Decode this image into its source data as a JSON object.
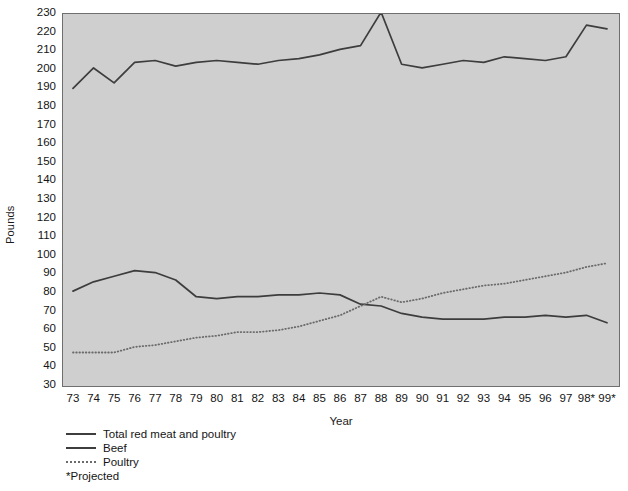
{
  "chart_data": {
    "type": "line",
    "title": "",
    "xlabel": "Year",
    "ylabel": "Pounds",
    "ylim": [
      30,
      230
    ],
    "ytick_step": 10,
    "grid": false,
    "legend_position": "below-left",
    "x": [
      "73",
      "74",
      "75",
      "76",
      "77",
      "78",
      "79",
      "80",
      "81",
      "82",
      "83",
      "84",
      "85",
      "86",
      "87",
      "88",
      "89",
      "90",
      "91",
      "92",
      "93",
      "94",
      "95",
      "96",
      "97",
      "98*",
      "99*"
    ],
    "categories": [
      "73",
      "74",
      "75",
      "76",
      "77",
      "78",
      "79",
      "80",
      "81",
      "82",
      "83",
      "84",
      "85",
      "86",
      "87",
      "88",
      "89",
      "90",
      "91",
      "92",
      "93",
      "94",
      "95",
      "96",
      "97",
      "98*",
      "99*"
    ],
    "ytick_labels": [
      "230",
      "220",
      "210",
      "200",
      "190",
      "180",
      "170",
      "160",
      "150",
      "140",
      "130",
      "120",
      "110",
      "100",
      "90",
      "80",
      "70",
      "60",
      "50",
      "40",
      "30"
    ],
    "series": [
      {
        "name": "Total red meat and poultry",
        "style": "solid",
        "color": "#3d3d3d",
        "values": [
          190,
          201,
          193,
          204,
          205,
          202,
          204,
          205,
          204,
          203,
          205,
          206,
          208,
          211,
          213,
          231,
          203,
          201,
          203,
          205,
          204,
          207,
          206,
          205,
          207,
          224,
          222
        ]
      },
      {
        "name": "Beef",
        "style": "solid",
        "color": "#3d3d3d",
        "values": [
          81,
          86,
          89,
          92,
          91,
          87,
          78,
          77,
          78,
          78,
          79,
          79,
          80,
          79,
          74,
          73,
          69,
          67,
          66,
          66,
          66,
          67,
          67,
          68,
          67,
          68,
          64
        ]
      },
      {
        "name": "Poultry",
        "style": "dotted",
        "color": "#6b6b6b",
        "values": [
          48,
          48,
          48,
          51,
          52,
          54,
          56,
          57,
          59,
          59,
          60,
          62,
          65,
          68,
          73,
          78,
          75,
          77,
          80,
          82,
          84,
          85,
          87,
          89,
          91,
          94,
          96
        ]
      }
    ],
    "footnote": "*Projected"
  },
  "legend": {
    "items": [
      {
        "label": "Total red meat and poultry",
        "style": "solid"
      },
      {
        "label": "Beef",
        "style": "solid"
      },
      {
        "label": "Poultry",
        "style": "dotted"
      }
    ],
    "note": "*Projected"
  },
  "colors": {
    "plot_background": "#cfcfcf",
    "frame": "#6e6e6e",
    "line_solid": "#3d3d3d",
    "line_dotted": "#6b6b6b",
    "text": "#151515"
  }
}
